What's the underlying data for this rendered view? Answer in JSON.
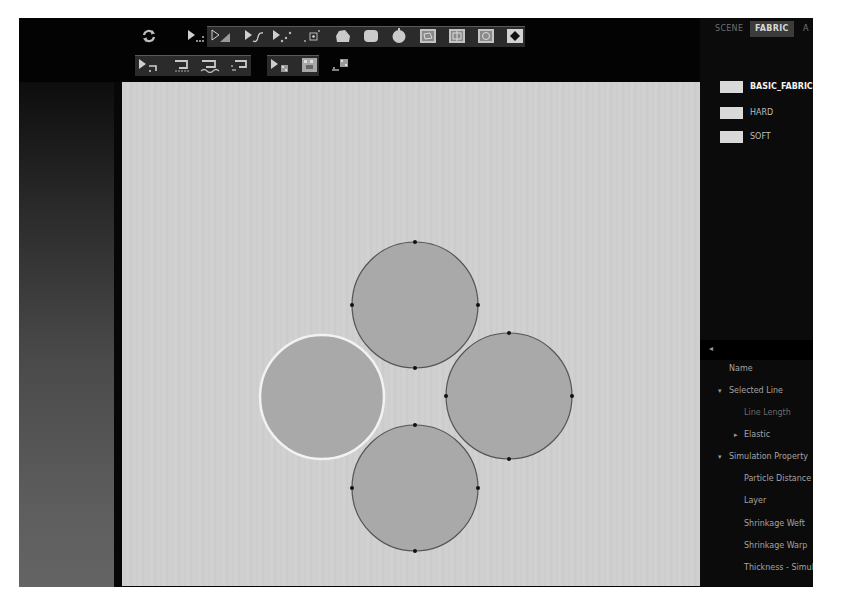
{
  "colors": {
    "window_bg": "#050505",
    "canvas_bg": "#cfcfcf",
    "pattern_fill": "#a9a9a9",
    "pattern_stroke": "#5e5e5e",
    "selected_outline": "#f0f0f0",
    "handle": "#111111",
    "swatch": "#d9d9d9"
  },
  "toolbar": {
    "row1": [
      {
        "name": "refresh-icon",
        "label": "Refresh"
      },
      {
        "name": "select-points-icon",
        "label": "Select Points"
      },
      {
        "name": "transform-pattern-icon",
        "label": "Transform Pattern"
      },
      {
        "name": "edit-curve-icon",
        "label": "Edit Curve"
      },
      {
        "name": "edit-points-icon",
        "label": "Edit Points"
      },
      {
        "name": "add-point-icon",
        "label": "Add Point"
      },
      {
        "name": "polygon-icon",
        "label": "Polygon"
      },
      {
        "name": "rectangle-icon",
        "label": "Rectangle"
      },
      {
        "name": "circle-icon",
        "label": "Circle"
      },
      {
        "name": "internal-polygon-icon",
        "label": "Internal Polygon"
      },
      {
        "name": "internal-rectangle-icon",
        "label": "Internal Rectangle"
      },
      {
        "name": "internal-circle-icon",
        "label": "Internal Circle"
      },
      {
        "name": "dart-icon",
        "label": "Dart"
      }
    ],
    "row2": [
      {
        "name": "edit-sewing-icon",
        "label": "Edit Sewing"
      },
      {
        "name": "segment-sewing-icon",
        "label": "Segment Sewing"
      },
      {
        "name": "free-sewing-icon",
        "label": "Free Sewing"
      },
      {
        "name": "multi-sewing-icon",
        "label": "Multi Sewing"
      },
      {
        "name": "edit-texture-icon",
        "label": "Edit Texture"
      },
      {
        "name": "texture-pattern-icon",
        "label": "Texture Pattern"
      },
      {
        "name": "graphic-icon",
        "label": "Graphic"
      }
    ]
  },
  "right_panel": {
    "tabs": [
      {
        "label": "SCENE",
        "active": false
      },
      {
        "label": "FABRIC",
        "active": true
      },
      {
        "label": "A",
        "active": false
      }
    ],
    "fabrics": [
      {
        "label": "BASIC_FABRIC",
        "selected": true
      },
      {
        "label": "HARD",
        "selected": false
      },
      {
        "label": "SOFT",
        "selected": false
      }
    ],
    "property_header_arrow": "◂",
    "properties": [
      {
        "label": "Name",
        "level": 0,
        "toggle": ""
      },
      {
        "label": "Selected Line",
        "level": 0,
        "toggle": "▾"
      },
      {
        "label": "Line Length",
        "level": 1,
        "toggle": "",
        "dim": true
      },
      {
        "label": "Elastic",
        "level": 1,
        "toggle": "▸"
      },
      {
        "label": "Simulation Property",
        "level": 0,
        "toggle": "▾"
      },
      {
        "label": "Particle Distance (",
        "level": 1,
        "toggle": ""
      },
      {
        "label": "Layer",
        "level": 1,
        "toggle": ""
      },
      {
        "label": "Shrinkage Weft",
        "level": 1,
        "toggle": ""
      },
      {
        "label": "Shrinkage Warp",
        "level": 1,
        "toggle": ""
      },
      {
        "label": "Thickness - Simula",
        "level": 1,
        "toggle": ""
      }
    ]
  },
  "canvas": {
    "patterns": [
      {
        "name": "pattern-circle-top",
        "cx": 293,
        "cy": 223,
        "r": 63,
        "selected": false
      },
      {
        "name": "pattern-circle-right",
        "cx": 387,
        "cy": 314,
        "r": 63,
        "selected": false
      },
      {
        "name": "pattern-circle-bottom",
        "cx": 293,
        "cy": 406,
        "r": 63,
        "selected": false
      },
      {
        "name": "pattern-circle-left",
        "cx": 200,
        "cy": 315,
        "r": 62,
        "selected": true
      }
    ]
  }
}
